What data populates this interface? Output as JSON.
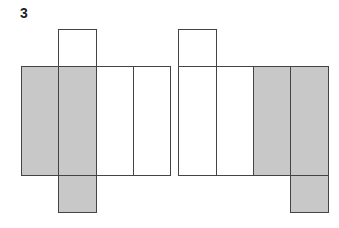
{
  "label": "3",
  "colors": {
    "shaded": "#c8c8c8",
    "blank": "#ffffff",
    "stroke": "#444444"
  },
  "figures": [
    {
      "name": "net-left",
      "cells": [
        {
          "x": 58,
          "y": 29,
          "w": 38,
          "h": 37,
          "shaded": false
        },
        {
          "x": 21,
          "y": 66,
          "w": 37,
          "h": 109,
          "shaded": true
        },
        {
          "x": 58,
          "y": 66,
          "w": 38,
          "h": 109,
          "shaded": true
        },
        {
          "x": 96,
          "y": 66,
          "w": 37,
          "h": 109,
          "shaded": false
        },
        {
          "x": 133,
          "y": 66,
          "w": 37,
          "h": 109,
          "shaded": false
        },
        {
          "x": 58,
          "y": 175,
          "w": 38,
          "h": 37,
          "shaded": true
        }
      ]
    },
    {
      "name": "net-right",
      "cells": [
        {
          "x": 178,
          "y": 29,
          "w": 38,
          "h": 37,
          "shaded": false
        },
        {
          "x": 178,
          "y": 66,
          "w": 38,
          "h": 109,
          "shaded": false
        },
        {
          "x": 216,
          "y": 66,
          "w": 37,
          "h": 109,
          "shaded": false
        },
        {
          "x": 253,
          "y": 66,
          "w": 37,
          "h": 109,
          "shaded": true
        },
        {
          "x": 290,
          "y": 66,
          "w": 38,
          "h": 109,
          "shaded": true
        },
        {
          "x": 290,
          "y": 175,
          "w": 38,
          "h": 37,
          "shaded": true
        }
      ]
    }
  ]
}
